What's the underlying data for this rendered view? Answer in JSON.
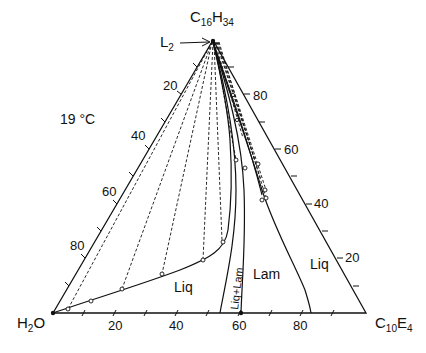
{
  "diagram": {
    "type": "ternary-phase-diagram",
    "temperature_label": "19 °C",
    "vertices": {
      "top": {
        "base": "C",
        "sub1": "16",
        "mid": "H",
        "sub2": "34"
      },
      "left": {
        "base": "H",
        "sub1": "2",
        "mid": "O",
        "sub2": ""
      },
      "right": {
        "base": "C",
        "sub1": "10",
        "mid": "E",
        "sub2": "4"
      }
    },
    "phase_labels": {
      "l2": {
        "base": "L",
        "sub": "2"
      },
      "liq_left": "Liq",
      "lam": "Lam",
      "liq_right": "Liq",
      "liq_lam": "Liq+Lam"
    },
    "axes": {
      "bottom_ticks": [
        "20",
        "40",
        "60",
        "80"
      ],
      "left_ticks": [
        "20",
        "40",
        "60",
        "80"
      ],
      "right_ticks": [
        "80",
        "60",
        "40",
        "20"
      ]
    },
    "colors": {
      "line": "#111111",
      "background": "#ffffff"
    }
  }
}
